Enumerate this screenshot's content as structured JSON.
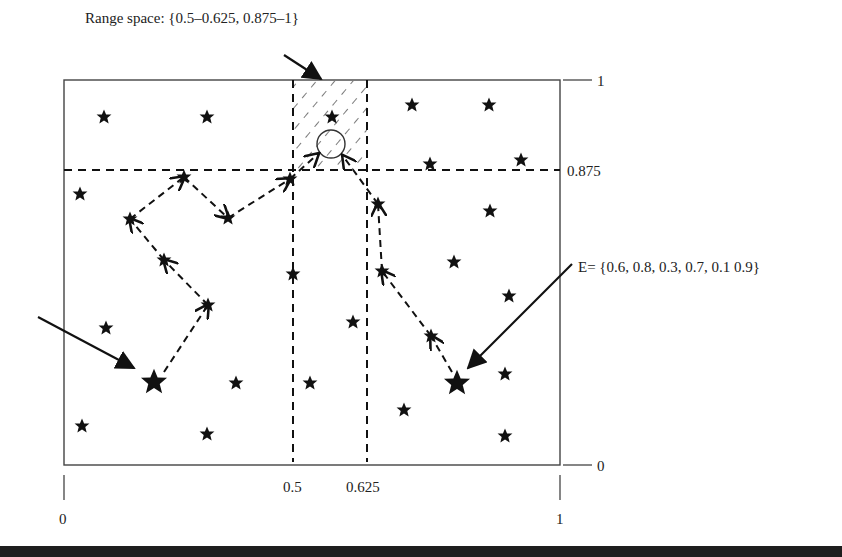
{
  "diagram": {
    "type": "search-space-particle-paths",
    "annotations": {
      "range_space": "Range space: {0.5–0.625, 0.875–1}",
      "e_set": "E= {0.6, 0.8, 0.3, 0.7, 0.1 0.9}"
    },
    "axes": {
      "x_ticks": [
        {
          "label": "0",
          "value": 0
        },
        {
          "label": "0.5",
          "value": 0.5
        },
        {
          "label": "0.625",
          "value": 0.625
        },
        {
          "label": "1",
          "value": 1
        }
      ],
      "y_ticks": [
        {
          "label": "0",
          "value": 0
        },
        {
          "label": "0.875",
          "value": 0.875
        },
        {
          "label": "1",
          "value": 1
        }
      ]
    },
    "colors": {
      "ink": "#1a1a1a",
      "background": "#ffffff",
      "bottom_bar": "#1e1e1e"
    }
  }
}
